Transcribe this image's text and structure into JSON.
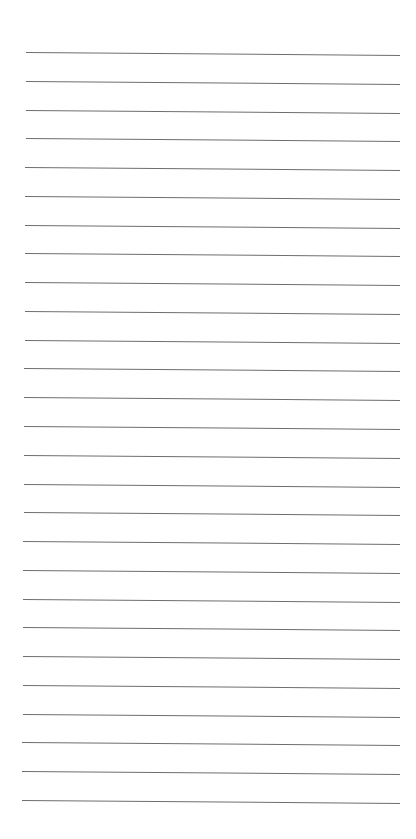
{
  "page": {
    "type": "lined-paper",
    "background_color": "#ffffff",
    "line_color": "#6e6e6e",
    "line_count": 27,
    "first_line_y": 52,
    "line_spacing": 28.77,
    "line_left_x": 26,
    "line_right_x": 400,
    "slight_skew_deg": 0.45
  }
}
